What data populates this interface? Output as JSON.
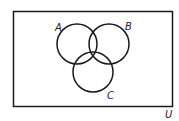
{
  "diagram": {
    "type": "venn",
    "universe_label": "U",
    "sets": [
      {
        "label": "A"
      },
      {
        "label": "B"
      },
      {
        "label": "C"
      }
    ]
  }
}
